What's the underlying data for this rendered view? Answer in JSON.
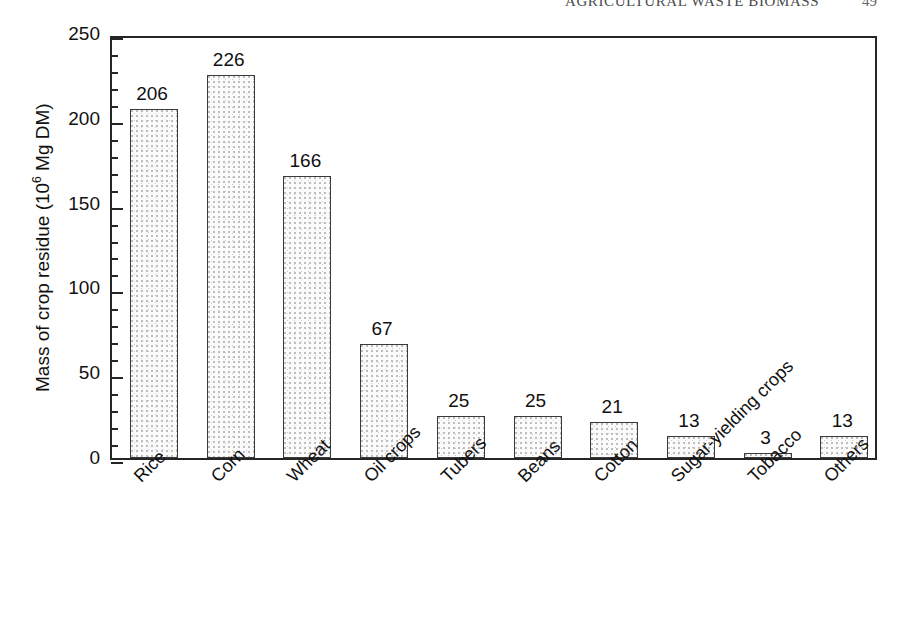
{
  "header": {
    "title": "AGRICULTURAL WASTE BIOMASS",
    "page_number": "49"
  },
  "chart_data": {
    "type": "bar",
    "title": "",
    "xlabel": "",
    "ylabel": "Mass of crop residue (10⁶ Mg DM)",
    "ylabel_prefix": "Mass of crop residue (10",
    "ylabel_exponent": "6",
    "ylabel_suffix": " Mg DM)",
    "categories": [
      "Rice",
      "Corn",
      "Wheat",
      "Oil crops",
      "Tubers",
      "Beans",
      "Cotton",
      "Sugar-yielding crops",
      "Tobacco",
      "Others"
    ],
    "values": [
      206,
      226,
      166,
      67,
      25,
      25,
      21,
      13,
      3,
      13
    ],
    "value_labels": [
      "206",
      "226",
      "166",
      "67",
      "25",
      "25",
      "21",
      "13",
      "3",
      "13"
    ],
    "ylim": [
      0,
      250
    ],
    "ytick_labels": [
      "0",
      "50",
      "100",
      "150",
      "200",
      "250"
    ],
    "ytick_values": [
      0,
      50,
      100,
      150,
      200,
      250
    ],
    "minor_tick_interval": 10,
    "grid": false,
    "legend": false,
    "bar_fill": "#fbfbfb",
    "bar_border_color": "#3a3a3a",
    "axis_color": "#262626"
  }
}
